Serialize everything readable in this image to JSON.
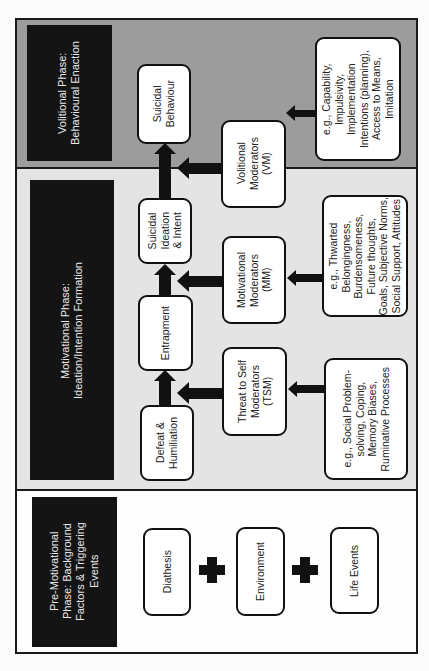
{
  "colors": {
    "volitional_band": "#9c9c9c",
    "motivational_band": "#e4e4e4",
    "premotivational_band": "#fefefe",
    "header_bg": "#141414",
    "header_text": "#e8e8e8",
    "box_border": "#111111"
  },
  "phases": {
    "volitional": {
      "header": "Volitional Phase:\nBehavioural Enaction",
      "outcome": "Suicidal\nBehaviour",
      "moderator": "Volitional\nModerators\n(VM)",
      "examples": "e.g., Capability,\nImpulsivity,\nImplementation\nIntentions (planning),\nAccess to Means,\nImitation"
    },
    "motivational": {
      "header": "Motivational Phase:\nIdeation/Intention Formation",
      "stages": [
        {
          "label": "Suicidal\nIdeation\n& Intent"
        },
        {
          "label": "Entrapment"
        },
        {
          "label": "Defeat &\nHumiliation"
        }
      ],
      "moderators": [
        {
          "label": "Motivational\nModerators\n(MM)",
          "examples": "e.g., Thwarted\nBelongingness,\nBurdensomeness,\nFuture thoughts,\nGoals, Subjective Norms,\nSocial Support, Attitudes"
        },
        {
          "label": "Threat to Self\nModerators\n(TSM)",
          "examples": "e.g., Social Problem-\nsolving, Coping,\nMemory Biases,\nRuminative Processes"
        }
      ]
    },
    "premotivational": {
      "header": "Pre-Motivational\nPhase: Background\nFactors & Triggering\nEvents",
      "factors": [
        {
          "label": "Diathesis"
        },
        {
          "label": "Environment"
        },
        {
          "label": "Life Events"
        }
      ],
      "connector": "plus"
    }
  }
}
